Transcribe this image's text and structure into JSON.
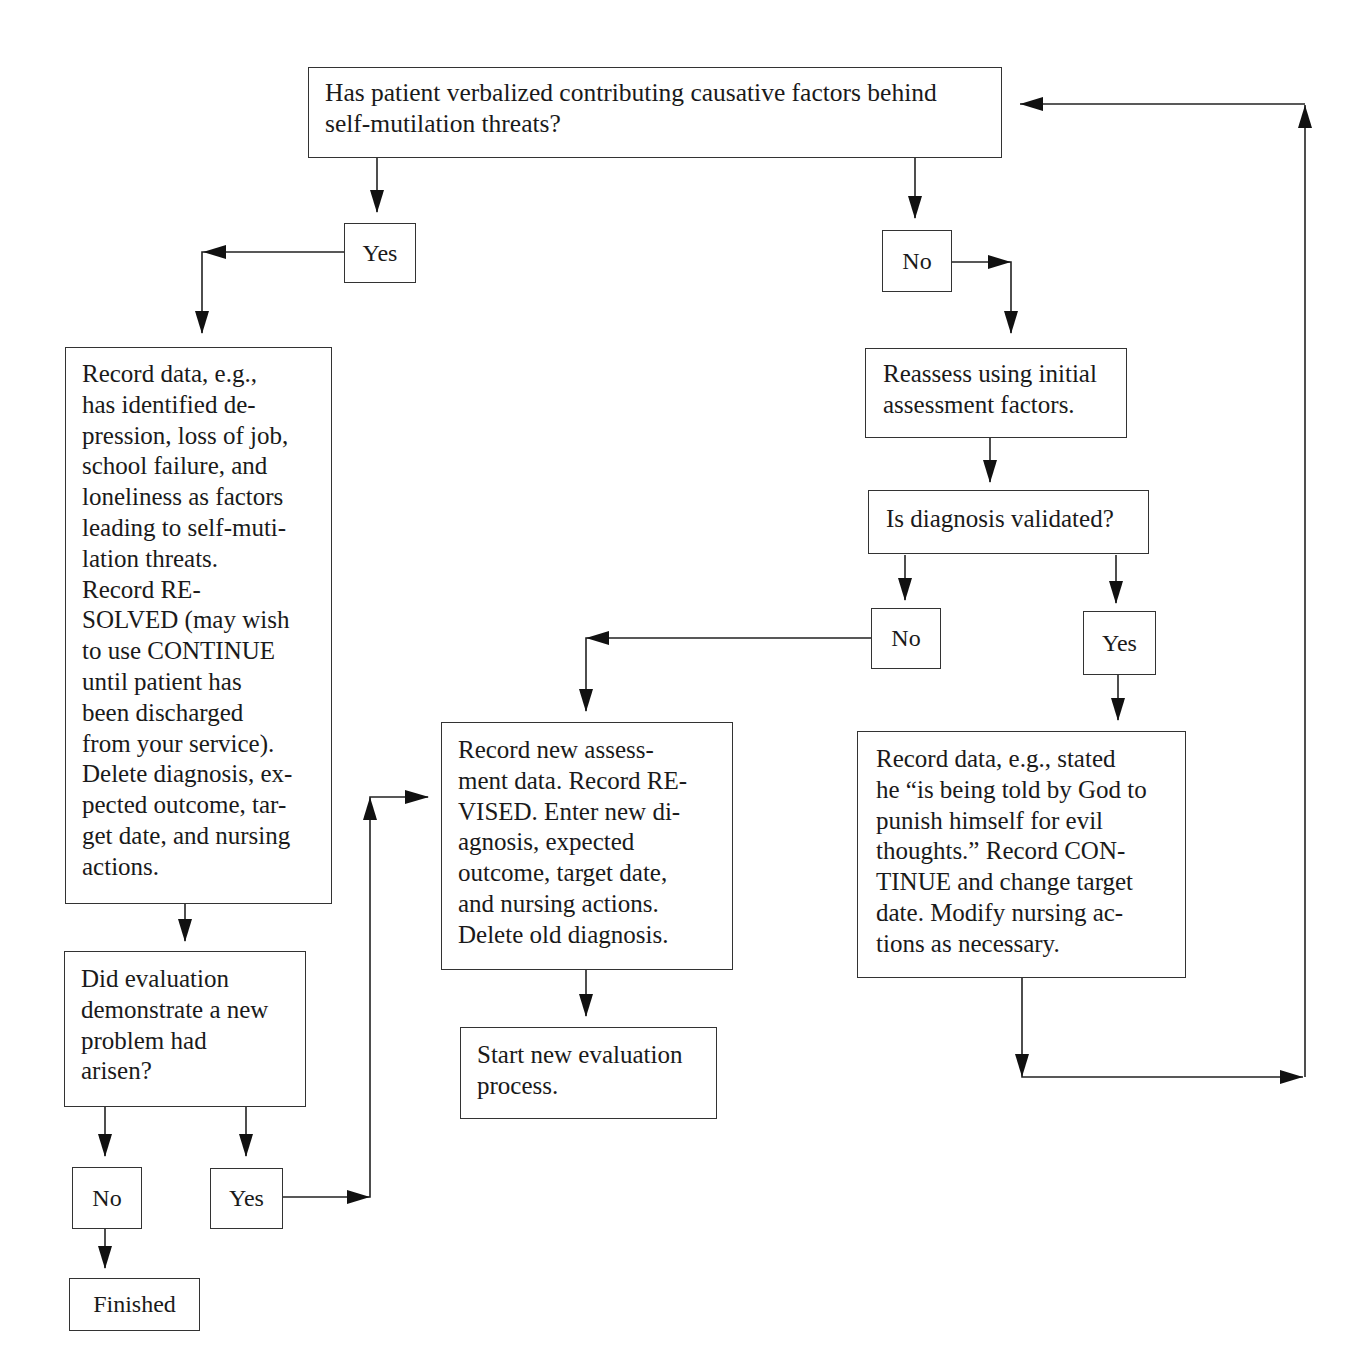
{
  "diagram": {
    "type": "flowchart",
    "nodes": {
      "q_verbalized": "Has patient verbalized contributing causative factors behind\nself-mutilation threats?",
      "yes_1": "Yes",
      "no_1": "No",
      "record_resolved": "Record data, e.g.,\nhas identified de-\npression, loss of job,\nschool failure, and\nloneliness as factors\nleading to self-muti-\nlation threats.\nRecord RE-\nSOLVED (may wish\nto use CONTINUE\nuntil patient has\nbeen discharged\nfrom your service).\nDelete diagnosis, ex-\npected outcome, tar-\nget date, and nursing\nactions.",
      "reassess": "Reassess using initial\nassessment factors.",
      "q_validated": "Is diagnosis validated?",
      "no_2": "No",
      "yes_2": "Yes",
      "record_revised": "Record new assess-\nment data. Record RE-\nVISED. Enter new di-\nagnosis, expected\noutcome, target date,\nand nursing actions.\nDelete old diagnosis.",
      "record_continue": "Record data, e.g., stated\nhe “is being told by God to\npunish himself for evil\nthoughts.” Record CON-\nTINUE and change target\ndate. Modify nursing ac-\ntions as necessary.",
      "start_new": "Start new evaluation\nprocess.",
      "q_new_problem": "Did evaluation\ndemonstrate a new\nproblem had\narisen?",
      "no_3": "No",
      "yes_3": "Yes",
      "finished": "Finished"
    },
    "edges": [
      {
        "from": "q_verbalized",
        "to": "yes_1"
      },
      {
        "from": "q_verbalized",
        "to": "no_1"
      },
      {
        "from": "yes_1",
        "to": "record_resolved"
      },
      {
        "from": "no_1",
        "to": "reassess"
      },
      {
        "from": "reassess",
        "to": "q_validated"
      },
      {
        "from": "q_validated",
        "to": "no_2"
      },
      {
        "from": "q_validated",
        "to": "yes_2"
      },
      {
        "from": "no_2",
        "to": "record_revised"
      },
      {
        "from": "yes_2",
        "to": "record_continue"
      },
      {
        "from": "record_continue",
        "to": "q_verbalized"
      },
      {
        "from": "record_revised",
        "to": "start_new"
      },
      {
        "from": "record_resolved",
        "to": "q_new_problem"
      },
      {
        "from": "q_new_problem",
        "to": "no_3"
      },
      {
        "from": "q_new_problem",
        "to": "yes_3"
      },
      {
        "from": "yes_3",
        "to": "record_revised"
      },
      {
        "from": "no_3",
        "to": "finished"
      }
    ]
  }
}
